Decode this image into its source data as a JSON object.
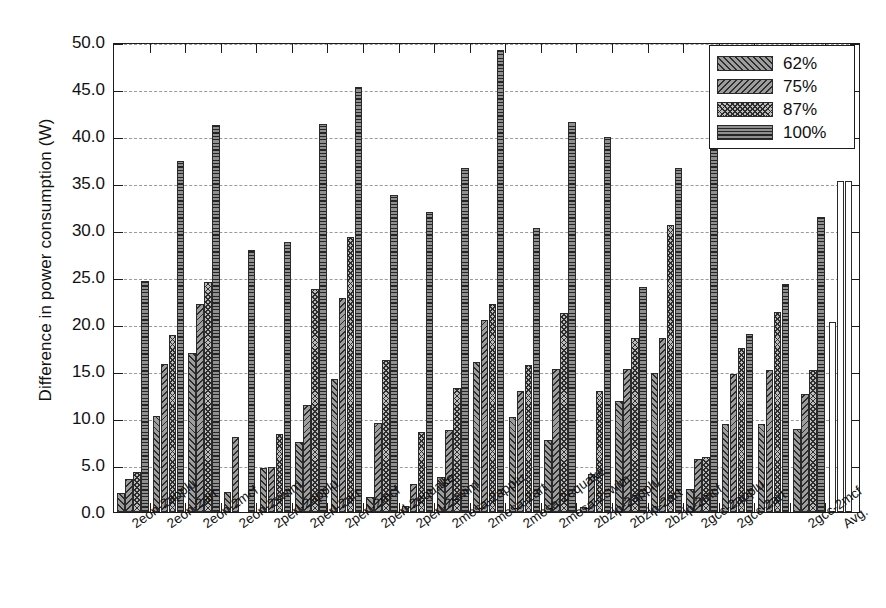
{
  "chart_data": {
    "type": "bar",
    "title": "",
    "xlabel": "",
    "ylabel": "Difference in power consumption (W)",
    "ylim": [
      0,
      50
    ],
    "ytick_labels": [
      "0.0",
      "5.0",
      "10.0",
      "15.0",
      "20.0",
      "25.0",
      "30.0",
      "35.0",
      "40.0",
      "45.0",
      "50.0"
    ],
    "ytick_values": [
      0,
      5,
      10,
      15,
      20,
      25,
      30,
      35,
      40,
      45,
      50
    ],
    "grid": "horizontal-dashed",
    "legend_position": "top-right",
    "categories": [
      "2eon-2applu",
      "2eon-2art",
      "2eon-2mcf",
      "2eon-2swim",
      "2perl-2applu",
      "2perl-2art",
      "2perl-2mcf",
      "2perl-2equake",
      "2perl-2swim",
      "2mesa-2applu",
      "2mesa-2art",
      "2mesa-2equake",
      "2mesa-2swim",
      "2bzip-2applu",
      "2bzip-2art",
      "2bzip-2mcf",
      "2gcc-2applu",
      "2gcc-2art",
      "2gcc-2mcf",
      "Avg."
    ],
    "series": [
      {
        "name": "62%",
        "pattern": "forward-diagonal-hatch",
        "values": [
          2.0,
          0.0,
          0.0,
          1.9,
          0.0,
          0.0,
          1.6,
          0.0,
          0.0,
          0.0,
          0.0,
          0.0,
          0.4,
          0.0,
          0.0,
          2.4,
          0.0,
          0.0,
          0.0,
          0.0
        ]
      },
      {
        "name": "75%",
        "pattern": "backward-diagonal-hatch",
        "values": [
          3.5,
          10.2,
          8.0,
          4.7,
          7.4,
          14.2,
          0.0,
          0.0,
          3.7,
          16.0,
          10.1,
          7.7,
          4.0,
          11.8,
          14.8,
          0.0,
          14.7,
          21.3,
          8.8,
          0.0
        ]
      },
      {
        "name": "87%",
        "pattern": "diamond-crosshatch",
        "values": [
          4.3,
          15.7,
          0.0,
          4.8,
          9.5,
          22.8,
          3.0,
          8.5,
          8.7,
          20.4,
          12.9,
          15.2,
          0.0,
          18.5,
          15.0,
          5.6,
          9.4,
          15.1,
          12.6,
          20.2
        ]
      },
      {
        "name": "100%",
        "pattern": "horizontal-lines",
        "values": [
          24.6,
          18.8,
          0.0,
          8.3,
          11.4,
          29.3,
          6.7,
          15.0,
          13.2,
          22.1,
          15.6,
          21.2,
          0.0,
          30.5,
          36.2,
          5.8,
          17.5,
          24.3,
          0.0,
          35.2
        ]
      }
    ],
    "bar_groups": [
      {
        "label": "2eon-2applu",
        "bars": [
          2.0,
          3.5,
          4.3,
          24.6
        ]
      },
      {
        "label": "2eon-2art",
        "bars": [
          10.2,
          15.7,
          18.8,
          37.3
        ]
      },
      {
        "label": "2eon-2mcf",
        "bars": [
          16.9,
          22.1,
          24.5,
          41.2
        ]
      },
      {
        "label": "2eon-2swim",
        "bars": [
          2.1,
          8.0,
          0.0,
          27.9
        ]
      },
      {
        "label": "2perl-2applu",
        "bars": [
          4.7,
          4.8,
          8.3,
          28.7
        ]
      },
      {
        "label": "2perl-2art",
        "bars": [
          7.4,
          11.4,
          23.7,
          41.3
        ]
      },
      {
        "label": "2perl-2mcf",
        "bars": [
          14.2,
          22.8,
          29.3,
          45.2
        ]
      },
      {
        "label": "2perl-2equake",
        "bars": [
          1.6,
          9.5,
          16.2,
          33.7
        ]
      },
      {
        "label": "2perl-2swim",
        "bars": [
          0.6,
          3.0,
          8.5,
          31.9
        ]
      },
      {
        "label": "2mesa-2applu",
        "bars": [
          3.7,
          8.7,
          13.2,
          36.6
        ]
      },
      {
        "label": "2mesa-2art",
        "bars": [
          16.0,
          20.4,
          22.1,
          49.2
        ]
      },
      {
        "label": "2mesa-2equake",
        "bars": [
          10.1,
          12.9,
          15.6,
          30.2
        ]
      },
      {
        "label": "2mesa-2swim",
        "bars": [
          7.7,
          15.2,
          21.2,
          41.5
        ]
      },
      {
        "label": "2bzip-2applu",
        "bars": [
          0.5,
          4.0,
          12.9,
          39.9
        ]
      },
      {
        "label": "2bzip-2art",
        "bars": [
          11.8,
          15.2,
          18.5,
          23.9
        ]
      },
      {
        "label": "2bzip-2mcf",
        "bars": [
          14.8,
          18.5,
          30.5,
          36.6
        ]
      },
      {
        "label": "2gcc-2applu",
        "bars": [
          2.4,
          5.6,
          5.8,
          40.5
        ]
      },
      {
        "label": "2gcc-2art",
        "bars": [
          9.4,
          14.7,
          17.5,
          18.9
        ]
      },
      {
        "label": "2gcc-2mcf",
        "bars": [
          9.4,
          15.1,
          21.3,
          24.3
        ]
      },
      {
        "label": "2gcc-2mcf-b",
        "bars": [
          8.8,
          12.6,
          15.1,
          31.4
        ]
      },
      {
        "label": "Avg.",
        "bars": [
          20.2,
          35.2,
          35.2,
          0.0
        ]
      }
    ]
  },
  "legend": {
    "items": [
      {
        "label": "62%",
        "swatch": "forward-diagonal-hatch"
      },
      {
        "label": "75%",
        "swatch": "backward-diagonal-hatch"
      },
      {
        "label": "87%",
        "swatch": "diamond-crosshatch"
      },
      {
        "label": "100%",
        "swatch": "horizontal-lines"
      }
    ]
  },
  "axes": {
    "y_title": "Difference in power consumption (W)",
    "y_ticks": [
      "0.0",
      "5.0",
      "10.0",
      "15.0",
      "20.0",
      "25.0",
      "30.0",
      "35.0",
      "40.0",
      "45.0",
      "50.0"
    ],
    "x_ticks": [
      "2eon-2applu",
      "2eon-2art",
      "2eon-2mcf",
      "2eon-2swim",
      "2perl-2applu",
      "2perl-2art",
      "2perl-2mcf",
      "2perl-2equake",
      "2perl-2swim",
      "2mesa-2applu",
      "2mesa-2art",
      "2mesa-2equake",
      "2mesa-2swim",
      "2bzip-2applu",
      "2bzip-2art",
      "2bzip-2mcf",
      "2gcc-2applu",
      "2gcc-2art",
      "2gcc-2mcf",
      "Avg."
    ]
  },
  "colors": {
    "axis": "#1c1c1c",
    "grid": "#9a9a9a",
    "bar_base_dark": "#8f8f8f",
    "bar_base_mid": "#9d9d9d",
    "bar_base_light": "#bdbdbd",
    "avg_fill": "#ffffff",
    "text": "#111111"
  }
}
